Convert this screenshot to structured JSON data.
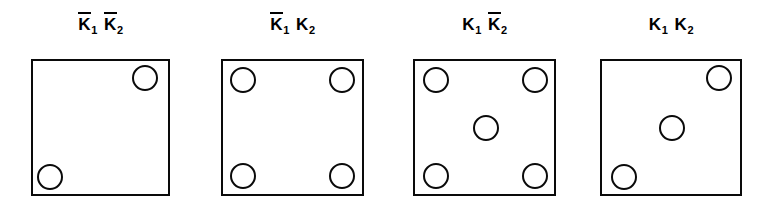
{
  "figure": {
    "type": "diagram",
    "background_color": "#ffffff",
    "stroke_color": "#0a0a0a",
    "fill_color": "#ffffff",
    "panel_count": 4,
    "circle_diameter_px": 26,
    "panels": [
      {
        "id": "panel-1",
        "label_parts": [
          {
            "symbol": "K",
            "bar": true,
            "subscript": "1"
          },
          {
            "symbol": "K",
            "bar": true,
            "subscript": "2"
          }
        ],
        "label_text": "K̄1 K̄2",
        "box": {
          "x": 31,
          "y": 59,
          "width": 139,
          "height": 137
        },
        "circle_count": 2,
        "circles": [
          {
            "name": "top-right",
            "cx": 145,
            "cy": 78,
            "r": 13
          },
          {
            "name": "bottom-left",
            "cx": 50,
            "cy": 177,
            "r": 13
          }
        ]
      },
      {
        "id": "panel-2",
        "label_parts": [
          {
            "symbol": "K",
            "bar": true,
            "subscript": "1"
          },
          {
            "symbol": "K",
            "bar": false,
            "subscript": "2"
          }
        ],
        "label_text": "K̄1 K2",
        "box": {
          "x": 221,
          "y": 59,
          "width": 143,
          "height": 137
        },
        "circle_count": 4,
        "circles": [
          {
            "name": "top-left",
            "cx": 243,
            "cy": 80,
            "r": 13
          },
          {
            "name": "top-right",
            "cx": 342,
            "cy": 80,
            "r": 13
          },
          {
            "name": "bottom-left",
            "cx": 243,
            "cy": 176,
            "r": 13
          },
          {
            "name": "bottom-right",
            "cx": 342,
            "cy": 176,
            "r": 13
          }
        ]
      },
      {
        "id": "panel-3",
        "label_parts": [
          {
            "symbol": "K",
            "bar": false,
            "subscript": "1"
          },
          {
            "symbol": "K",
            "bar": true,
            "subscript": "2"
          }
        ],
        "label_text": "K1 K̄2",
        "box": {
          "x": 413,
          "y": 59,
          "width": 143,
          "height": 137
        },
        "circle_count": 5,
        "circles": [
          {
            "name": "top-left",
            "cx": 436,
            "cy": 80,
            "r": 13
          },
          {
            "name": "top-right",
            "cx": 535,
            "cy": 80,
            "r": 13
          },
          {
            "name": "center",
            "cx": 486,
            "cy": 128,
            "r": 13
          },
          {
            "name": "bottom-left",
            "cx": 436,
            "cy": 176,
            "r": 13
          },
          {
            "name": "bottom-right",
            "cx": 535,
            "cy": 176,
            "r": 13
          }
        ]
      },
      {
        "id": "panel-4",
        "label_parts": [
          {
            "symbol": "K",
            "bar": false,
            "subscript": "1"
          },
          {
            "symbol": "K",
            "bar": false,
            "subscript": "2"
          }
        ],
        "label_text": "K1 K2",
        "box": {
          "x": 600,
          "y": 59,
          "width": 142,
          "height": 137
        },
        "circle_count": 3,
        "circles": [
          {
            "name": "top-right",
            "cx": 719,
            "cy": 78,
            "r": 13
          },
          {
            "name": "center",
            "cx": 672,
            "cy": 128,
            "r": 13
          },
          {
            "name": "bottom-left",
            "cx": 624,
            "cy": 177,
            "r": 13
          }
        ]
      }
    ]
  }
}
